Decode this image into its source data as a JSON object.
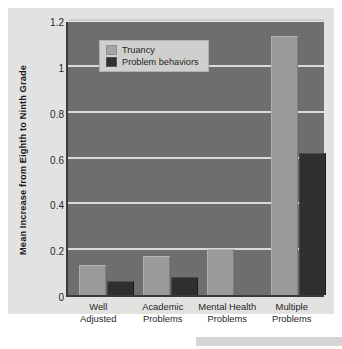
{
  "chart_data": {
    "type": "bar",
    "title": "",
    "xlabel": "",
    "ylabel": "Mean Increase from Eighth to Ninth Grade",
    "categories": [
      "Well Adjusted",
      "Academic Problems",
      "Mental Health Problems",
      "Multiple Problems"
    ],
    "category_lines": [
      [
        "Well",
        "Adjusted"
      ],
      [
        "Academic",
        "Problems"
      ],
      [
        "Mental Health",
        "Problems"
      ],
      [
        "Multiple",
        "Problems"
      ]
    ],
    "series": [
      {
        "name": "Truancy",
        "color": "#9b9b99",
        "values": [
          0.13,
          0.17,
          0.2,
          1.13
        ]
      },
      {
        "name": "Problem behaviors",
        "color": "#2f2f2f",
        "values": [
          0.06,
          0.08,
          0.0,
          0.62
        ]
      }
    ],
    "ylim": [
      0,
      1.2
    ],
    "yticks": [
      0,
      0.2,
      0.4,
      0.6,
      0.8,
      1,
      1.2
    ],
    "ytick_labels": [
      "0",
      "0.2",
      "0.4",
      "0.6",
      "0.8",
      "1",
      "1.2"
    ],
    "grid": true,
    "legend_position": "upper left",
    "plot_background": "#6e6e6e",
    "figure_background": "#e2e2e0",
    "gridline_color": "#d9d9d7"
  },
  "legend": {
    "items": [
      {
        "label": "Truancy"
      },
      {
        "label": "Problem behaviors"
      }
    ]
  }
}
